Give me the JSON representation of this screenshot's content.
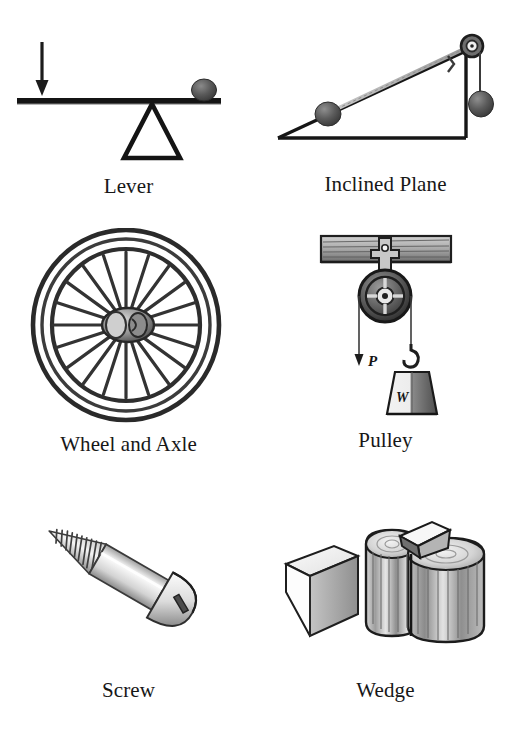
{
  "sheet": {
    "title": "The Six Simple Machines",
    "background_color": "#ffffff",
    "ink_color": "#1a1a1a",
    "layout": "2 columns x 3 rows",
    "style": "vintage engraved line illustrations with serif captions"
  },
  "palette": {
    "ink": "#1a1a1a",
    "line": "#222222",
    "mid_gray": "#6f6f6f",
    "light_gray": "#bdbdbd",
    "pale_gray": "#e2e2e2",
    "paper": "#ffffff"
  },
  "machines": [
    {
      "id": "lever",
      "caption": "Lever",
      "icon": "lever-icon",
      "parts": [
        "effort-arrow",
        "lever-bar",
        "fulcrum-triangle",
        "load-ball"
      ]
    },
    {
      "id": "inclined-plane",
      "caption": "Inclined Plane",
      "icon": "inclined-plane-icon",
      "parts": [
        "ramp-triangle",
        "rolling-ball",
        "apex-pulley",
        "hanging-weight",
        "rope"
      ]
    },
    {
      "id": "wheel-and-axle",
      "caption": "Wheel and Axle",
      "icon": "wheel-and-axle-icon",
      "spoke_count": 20,
      "parts": [
        "outer-rim",
        "inner-rim",
        "spokes",
        "hub",
        "axle"
      ]
    },
    {
      "id": "pulley",
      "caption": "Pulley",
      "icon": "pulley-icon",
      "labels": {
        "effort": "P",
        "load": "W"
      },
      "parts": [
        "ceiling-beam",
        "hanger-bracket",
        "sheave-wheel",
        "rope",
        "hook",
        "weight-block"
      ]
    },
    {
      "id": "screw",
      "caption": "Screw",
      "icon": "screw-icon",
      "thread_count": 12,
      "parts": [
        "round-slotted-head",
        "smooth-shank",
        "threads",
        "point"
      ]
    },
    {
      "id": "wedge",
      "caption": "Wedge",
      "icon": "wedge-icon",
      "parts": [
        "loose-wedge-prism",
        "split-log",
        "driven-wedge"
      ]
    }
  ]
}
